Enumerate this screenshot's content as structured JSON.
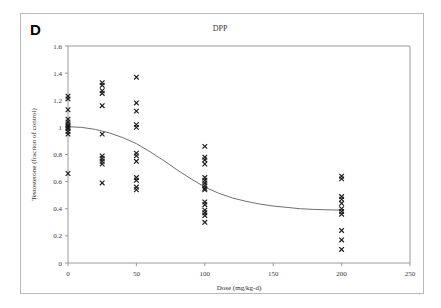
{
  "figure": {
    "panel_label": "D",
    "title": "DPP",
    "background_color": "#ffffff",
    "border_color": "#b9b9b9"
  },
  "chart_data": {
    "type": "scatter",
    "title": "DPP",
    "xlabel": "Dose (mg/kg-d)",
    "ylabel": "Testosterone (fraction of control)",
    "xlim": [
      0,
      250
    ],
    "ylim": [
      0,
      1.6
    ],
    "xticks": [
      0,
      50,
      100,
      150,
      200,
      250
    ],
    "yticks": [
      0,
      0.2,
      0.4,
      0.6,
      0.8,
      1,
      1.2,
      1.4,
      1.6
    ],
    "xtick_labels": [
      "0",
      "50",
      "100",
      "150",
      "200",
      "250"
    ],
    "ytick_labels": [
      "0",
      "0.2",
      "0.4",
      "0.6",
      "0.8",
      "1",
      "1.2",
      "1.4",
      "1.6"
    ],
    "grid": false,
    "legend": false,
    "marker_style": "x",
    "marker_color": "#1a1a1a",
    "series": [
      {
        "name": "Testosterone observations",
        "type": "scatter",
        "points": [
          {
            "x": 0,
            "y": 1.23
          },
          {
            "x": 0,
            "y": 1.21
          },
          {
            "x": 0,
            "y": 1.13
          },
          {
            "x": 0,
            "y": 1.06
          },
          {
            "x": 0,
            "y": 1.04
          },
          {
            "x": 0,
            "y": 1.02
          },
          {
            "x": 0,
            "y": 1.01
          },
          {
            "x": 0,
            "y": 1.0
          },
          {
            "x": 0,
            "y": 0.99
          },
          {
            "x": 0,
            "y": 0.97
          },
          {
            "x": 0,
            "y": 0.95
          },
          {
            "x": 0,
            "y": 0.66
          },
          {
            "x": 25,
            "y": 1.33
          },
          {
            "x": 25,
            "y": 1.31
          },
          {
            "x": 25,
            "y": 1.27
          },
          {
            "x": 25,
            "y": 1.25
          },
          {
            "x": 25,
            "y": 1.16
          },
          {
            "x": 25,
            "y": 0.95
          },
          {
            "x": 25,
            "y": 0.79
          },
          {
            "x": 25,
            "y": 0.77
          },
          {
            "x": 25,
            "y": 0.75
          },
          {
            "x": 25,
            "y": 0.73
          },
          {
            "x": 25,
            "y": 0.59
          },
          {
            "x": 50,
            "y": 1.37
          },
          {
            "x": 50,
            "y": 1.18
          },
          {
            "x": 50,
            "y": 1.12
          },
          {
            "x": 50,
            "y": 1.02
          },
          {
            "x": 50,
            "y": 1.0
          },
          {
            "x": 50,
            "y": 0.81
          },
          {
            "x": 50,
            "y": 0.79
          },
          {
            "x": 50,
            "y": 0.75
          },
          {
            "x": 50,
            "y": 0.63
          },
          {
            "x": 50,
            "y": 0.61
          },
          {
            "x": 50,
            "y": 0.56
          },
          {
            "x": 50,
            "y": 0.54
          },
          {
            "x": 100,
            "y": 0.86
          },
          {
            "x": 100,
            "y": 0.78
          },
          {
            "x": 100,
            "y": 0.76
          },
          {
            "x": 100,
            "y": 0.73
          },
          {
            "x": 100,
            "y": 0.63
          },
          {
            "x": 100,
            "y": 0.61
          },
          {
            "x": 100,
            "y": 0.59
          },
          {
            "x": 100,
            "y": 0.57
          },
          {
            "x": 100,
            "y": 0.55
          },
          {
            "x": 100,
            "y": 0.54
          },
          {
            "x": 100,
            "y": 0.45
          },
          {
            "x": 100,
            "y": 0.43
          },
          {
            "x": 100,
            "y": 0.39
          },
          {
            "x": 100,
            "y": 0.37
          },
          {
            "x": 100,
            "y": 0.35
          },
          {
            "x": 100,
            "y": 0.3
          },
          {
            "x": 200,
            "y": 0.64
          },
          {
            "x": 200,
            "y": 0.62
          },
          {
            "x": 200,
            "y": 0.49
          },
          {
            "x": 200,
            "y": 0.47
          },
          {
            "x": 200,
            "y": 0.44
          },
          {
            "x": 200,
            "y": 0.4
          },
          {
            "x": 200,
            "y": 0.38
          },
          {
            "x": 200,
            "y": 0.36
          },
          {
            "x": 200,
            "y": 0.24
          },
          {
            "x": 200,
            "y": 0.17
          },
          {
            "x": 200,
            "y": 0.1
          }
        ]
      },
      {
        "name": "Fitted dose-response curve",
        "type": "line",
        "color": "#6f6f6f",
        "points": [
          {
            "x": 0,
            "y": 1.005
          },
          {
            "x": 10,
            "y": 1.0
          },
          {
            "x": 20,
            "y": 0.985
          },
          {
            "x": 30,
            "y": 0.96
          },
          {
            "x": 40,
            "y": 0.925
          },
          {
            "x": 50,
            "y": 0.88
          },
          {
            "x": 60,
            "y": 0.82
          },
          {
            "x": 70,
            "y": 0.755
          },
          {
            "x": 80,
            "y": 0.685
          },
          {
            "x": 90,
            "y": 0.62
          },
          {
            "x": 100,
            "y": 0.56
          },
          {
            "x": 110,
            "y": 0.515
          },
          {
            "x": 120,
            "y": 0.48
          },
          {
            "x": 130,
            "y": 0.455
          },
          {
            "x": 140,
            "y": 0.435
          },
          {
            "x": 150,
            "y": 0.42
          },
          {
            "x": 160,
            "y": 0.41
          },
          {
            "x": 170,
            "y": 0.4
          },
          {
            "x": 180,
            "y": 0.395
          },
          {
            "x": 190,
            "y": 0.392
          },
          {
            "x": 200,
            "y": 0.39
          }
        ]
      }
    ]
  }
}
